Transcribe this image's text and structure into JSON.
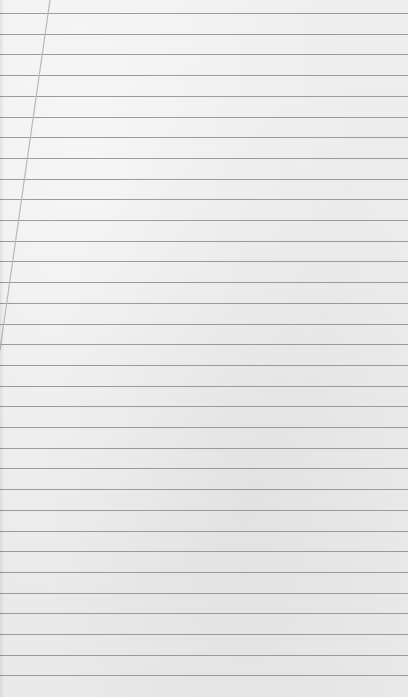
{
  "image": {
    "description": "Blank sheet of ruled notebook paper with faint show-through marks",
    "background_color": "#ececec",
    "rule_color": "#8c8c8c",
    "margin_line_color": "#b8b8b8",
    "rule_spacing_px": 20.7,
    "first_rule_y": 13,
    "rule_count": 33,
    "margin_line": {
      "x_top": 50,
      "y_top": 0,
      "x_bottom": 0,
      "y_bottom": 350
    }
  }
}
